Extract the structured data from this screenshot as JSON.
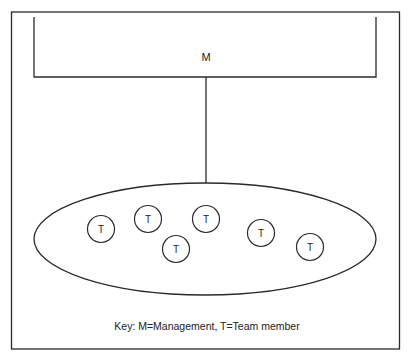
{
  "diagram": {
    "colors": {
      "stroke": "#2a2a2a",
      "background": "#ffffff",
      "text": "#222222"
    },
    "management": {
      "label": "M"
    },
    "team_members": [
      {
        "label": "T",
        "cx": 101,
        "cy": 229
      },
      {
        "label": "T",
        "cx": 148,
        "cy": 219
      },
      {
        "label": "T",
        "cx": 176,
        "cy": 249
      },
      {
        "label": "T",
        "cx": 206,
        "cy": 219
      },
      {
        "label": "T",
        "cx": 261,
        "cy": 233
      },
      {
        "label": "T",
        "cx": 310,
        "cy": 247
      }
    ],
    "key": {
      "text": "Key: M=Management, T=Team member"
    }
  }
}
